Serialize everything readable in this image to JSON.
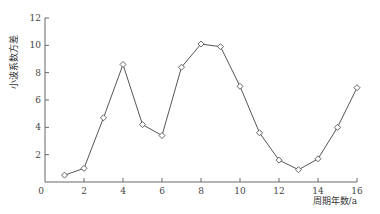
{
  "chart_data": {
    "type": "line",
    "title": "",
    "xlabel": "周期年数/a",
    "ylabel": "小波系数方差",
    "xlim": [
      0,
      16
    ],
    "ylim": [
      0,
      12
    ],
    "xticks": [
      0,
      2,
      4,
      6,
      8,
      10,
      12,
      14,
      16
    ],
    "yticks": [
      2,
      4,
      6,
      8,
      10,
      12
    ],
    "origin_label": "0",
    "grid": false,
    "legend": null,
    "marker": "diamond",
    "series": [
      {
        "name": "小波系数方差",
        "x": [
          1,
          2,
          3,
          4,
          5,
          6,
          7,
          8,
          9,
          10,
          11,
          12,
          13,
          14,
          15,
          16
        ],
        "y": [
          0.5,
          1.0,
          4.7,
          8.6,
          4.2,
          3.4,
          8.4,
          10.1,
          9.9,
          7.0,
          3.6,
          1.6,
          0.9,
          1.7,
          4.0,
          6.9
        ]
      }
    ]
  }
}
